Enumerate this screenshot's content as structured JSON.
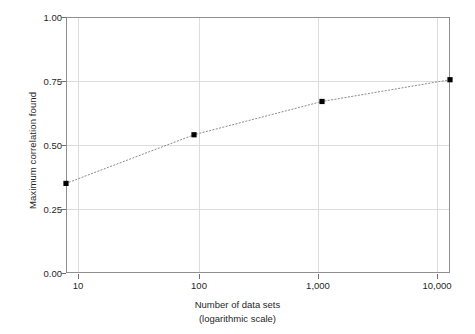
{
  "chart_data": {
    "type": "line",
    "title": "",
    "subtitle": "",
    "xlabel": "Number of data sets",
    "xlabel_line2": "(logarithmic scale)",
    "ylabel": "Maximum correlation found",
    "x_scale": "log",
    "x": [
      10,
      100,
      1000,
      10000
    ],
    "x_tick_labels": [
      "10",
      "100",
      "1,000",
      "10,000"
    ],
    "values": [
      0.35,
      0.54,
      0.67,
      0.755
    ],
    "y_tick_labels": [
      "0.00",
      "0.25",
      "0.50",
      "0.75",
      "1.00"
    ],
    "y_ticks": [
      0.0,
      0.25,
      0.5,
      0.75,
      1.0
    ],
    "ylim": [
      0.0,
      1.0
    ],
    "xlim": [
      10,
      10000
    ],
    "grid": true,
    "legend": "none",
    "series": [
      {
        "name": "Maximum correlation found",
        "values": [
          0.35,
          0.54,
          0.67,
          0.755
        ],
        "line_style": "dotted",
        "line_color": "#8a8a8a",
        "marker": "square",
        "marker_color": "#000000"
      }
    ],
    "colors": {
      "axis": "#8f8f8f",
      "grid": "#dcdcdc",
      "text": "#1f1f1f",
      "marker": "#000000",
      "line": "#8a8a8a",
      "background": "#ffffff"
    }
  }
}
